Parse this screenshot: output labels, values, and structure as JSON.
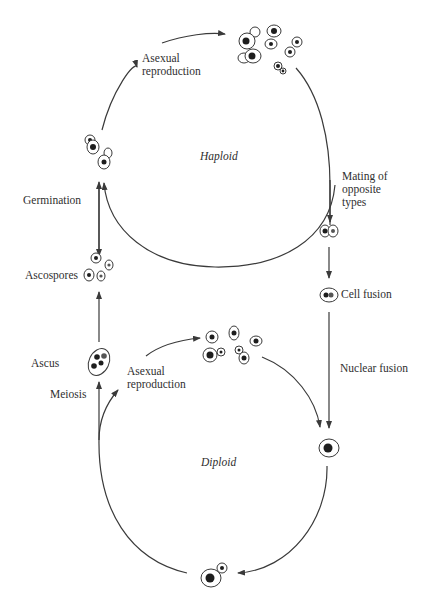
{
  "labels": {
    "haploid": "Haploid",
    "diploid": "Diploid",
    "asexual_top": "Asexual\nreproduction",
    "asexual_bottom": "Asexual\nreproduction",
    "germination": "Germination",
    "ascospores": "Ascospores",
    "ascus": "Ascus",
    "meiosis": "Meiosis",
    "mating": "Mating of\nopposite\ntypes",
    "cell_fusion": "Cell fusion",
    "nuclear_fusion": "Nuclear fusion"
  },
  "cycles": [
    {
      "name": "haploid-cycle",
      "label": "Haploid",
      "center": [
        214,
        160
      ],
      "radius": 118
    },
    {
      "name": "diploid-cycle",
      "label": "Diploid",
      "center": [
        216,
        440
      ],
      "radius": 118
    }
  ],
  "colors": {
    "line": "#3a3a3a",
    "nucleus": "#1e1e1e",
    "background": "#ffffff"
  }
}
